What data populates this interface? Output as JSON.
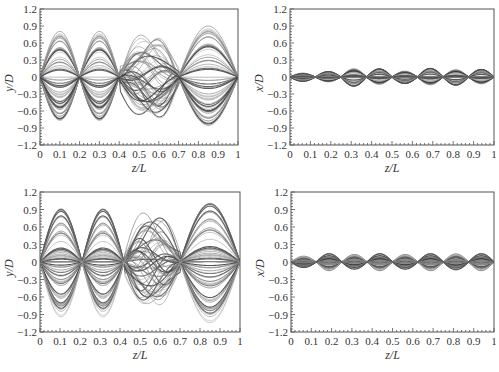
{
  "chart_data": [
    {
      "id": "top-left",
      "type": "line",
      "title": "",
      "xlabel": "z/L",
      "ylabel": "y/D",
      "xlim": [
        0,
        1
      ],
      "ylim": [
        -1.2,
        1.2
      ],
      "xticks": [
        "0",
        "0.1",
        "0.2",
        "0.3",
        "0.4",
        "0.5",
        "0.6",
        "0.7",
        "0.8",
        "0.9",
        "1"
      ],
      "yticks": [
        "1.2",
        "0.9",
        "0.6",
        "0.3",
        "0",
        "-0.3",
        "-0.6",
        "-0.9",
        "-1.2"
      ],
      "grid": false,
      "legend": null,
      "box": {
        "left": 40,
        "top": 9,
        "right": 238,
        "bottom": 145
      },
      "description": "Dense family of overlapping displacement profiles (many time snapshots) showing mode-like lobes; nodes near z/L=0, 0.2, 0.4(irregular), 0.7(irregular), 1",
      "envelope": {
        "segments": [
          {
            "z0": 0.0,
            "z1": 0.2,
            "peak": 0.85
          },
          {
            "z0": 0.2,
            "z1": 0.4,
            "peak": 0.85
          },
          {
            "z0": 0.4,
            "z1": 0.7,
            "peak": 0.8,
            "shifted": true
          },
          {
            "z0": 0.7,
            "z1": 1.0,
            "peak": 0.95
          }
        ],
        "series_count": 60
      }
    },
    {
      "id": "top-right",
      "type": "line",
      "title": "",
      "xlabel": "z/L",
      "ylabel": "x/D",
      "xlim": [
        0,
        1
      ],
      "ylim": [
        -1.2,
        1.2
      ],
      "xticks": [
        "0",
        "0.1",
        "0.2",
        "0.3",
        "0.4",
        "0.5",
        "0.6",
        "0.7",
        "0.8",
        "0.9",
        "1"
      ],
      "yticks": [
        "1.2",
        "0.9",
        "0.6",
        "0.3",
        "0",
        "-0.3",
        "-0.6",
        "-0.9",
        "-1.2"
      ],
      "grid": false,
      "legend": null,
      "box": {
        "left": 290,
        "top": 9,
        "right": 494,
        "bottom": 145
      },
      "description": "Dense family of small-amplitude profiles with 8 lobes along the span, amplitude about ±0.1 to ±0.18",
      "envelope": {
        "lobes": 8,
        "peaks": [
          0.08,
          0.1,
          0.17,
          0.15,
          0.12,
          0.16,
          0.15,
          0.14
        ],
        "series_count": 50
      }
    },
    {
      "id": "bottom-left",
      "type": "line",
      "title": "",
      "xlabel": "z/L",
      "ylabel": "y/D",
      "xlim": [
        0,
        1
      ],
      "ylim": [
        -1.2,
        1.2
      ],
      "xticks": [
        "0",
        "0.1",
        "0.2",
        "0.3",
        "0.4",
        "0.5",
        "0.6",
        "0.7",
        "0.8",
        "0.9",
        "1"
      ],
      "yticks": [
        "1.2",
        "0.9",
        "0.6",
        "0.3",
        "0",
        "-0.3",
        "-0.6",
        "-0.9",
        "-1.2"
      ],
      "grid": false,
      "legend": null,
      "box": {
        "left": 40,
        "top": 192,
        "right": 240,
        "bottom": 332
      },
      "description": "Dense family of overlapping displacement profiles with larger amplitude; peaks ~0.95 at z/L≈0.1 and 0.32, ~0.85 at 0.57, ~1.05 at 0.88",
      "envelope": {
        "segments": [
          {
            "z0": 0.0,
            "z1": 0.21,
            "peak": 0.95
          },
          {
            "z0": 0.21,
            "z1": 0.42,
            "peak": 0.95
          },
          {
            "z0": 0.42,
            "z1": 0.7,
            "peak": 0.85,
            "shifted": true
          },
          {
            "z0": 0.7,
            "z1": 1.0,
            "peak": 1.05
          }
        ],
        "series_count": 60
      }
    },
    {
      "id": "bottom-right",
      "type": "line",
      "title": "",
      "xlabel": "z/L",
      "ylabel": "x/D",
      "xlim": [
        0,
        1
      ],
      "ylim": [
        -1.2,
        1.2
      ],
      "xticks": [
        "0",
        "0.1",
        "0.2",
        "0.3",
        "0.4",
        "0.5",
        "0.6",
        "0.7",
        "0.8",
        "0.9",
        "1"
      ],
      "yticks": [
        "1.2",
        "0.9",
        "0.6",
        "0.3",
        "0",
        "-0.3",
        "-0.6",
        "-0.9",
        "-1.2"
      ],
      "grid": false,
      "legend": null,
      "box": {
        "left": 291,
        "top": 192,
        "right": 494,
        "bottom": 332
      },
      "description": "Dense family of small-amplitude profiles with 8 lobes along the span, amplitude about ±0.1 to ±0.17",
      "envelope": {
        "lobes": 8,
        "peaks": [
          0.1,
          0.15,
          0.13,
          0.15,
          0.13,
          0.15,
          0.14,
          0.15
        ],
        "series_count": 50
      }
    }
  ],
  "colors": {
    "axis": "#555555",
    "curve_dark": "#3a3a3a",
    "curve_light": "#b0b0b0",
    "background": "#ffffff"
  }
}
